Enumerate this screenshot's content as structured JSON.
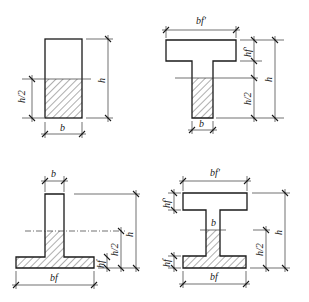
{
  "diagram": {
    "colors": {
      "line": "#1a1a1a",
      "background": "#ffffff",
      "hatch": "#333333"
    },
    "panels": [
      {
        "id": "rectangular",
        "shape": "rectangle",
        "labels": {
          "height": "h",
          "half_height": "h/2",
          "width": "b"
        }
      },
      {
        "id": "t-section",
        "shape": "T-beam (flange on top)",
        "labels": {
          "flange_width": "bf'",
          "flange_thickness": "hf'",
          "height": "h",
          "half_height": "h/2",
          "web_width": "b"
        }
      },
      {
        "id": "inverted-t-section",
        "shape": "inverted T-beam (flange on bottom)",
        "labels": {
          "web_width": "b",
          "height": "h",
          "half_height": "h/2",
          "flange_thickness": "hf",
          "flange_width": "bf"
        }
      },
      {
        "id": "i-section",
        "shape": "I-beam",
        "labels": {
          "top_flange_width": "bf'",
          "top_flange_thickness": "hf'",
          "height": "h",
          "half_height": "h/2",
          "web_width": "b",
          "bottom_flange_thickness": "hf",
          "bottom_flange_width": "bf"
        }
      }
    ]
  }
}
